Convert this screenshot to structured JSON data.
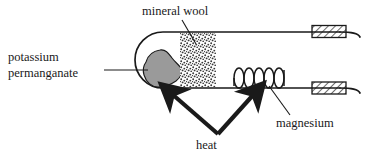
{
  "diagram": {
    "type": "chemistry-apparatus-diagram",
    "labels": {
      "mineral_wool": "mineral wool",
      "potassium_permanganate_line1": "potassium",
      "potassium_permanganate_line2": "permanganate",
      "heat": "heat",
      "magnesium": "magnesium"
    },
    "parts": [
      {
        "name": "test-tube",
        "description": "horizontal tube, rounded closed left end, open right end"
      },
      {
        "name": "potassium-permanganate-sample",
        "description": "grey irregular solid at closed end"
      },
      {
        "name": "mineral-wool-plug",
        "description": "stippled vertical band"
      },
      {
        "name": "magnesium-coil",
        "description": "coiled ribbon, 6 loops"
      },
      {
        "name": "clamp-upper",
        "description": "hatched rectangle"
      },
      {
        "name": "clamp-lower",
        "description": "hatched rectangle"
      },
      {
        "name": "heat-arrow-left",
        "description": "arrow pointing up-left toward permanganate"
      },
      {
        "name": "heat-arrow-right",
        "description": "arrow pointing up-right toward magnesium"
      }
    ],
    "colors": {
      "stroke": "#1a1a1a",
      "sample_fill": "#9a9a9a",
      "hatch": "#1a1a1a",
      "background": "#ffffff"
    }
  }
}
